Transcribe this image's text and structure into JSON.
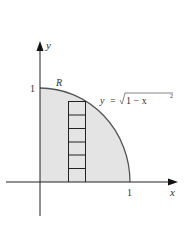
{
  "figure": {
    "axis_labels": {
      "x": "x",
      "y": "y"
    },
    "ticks": {
      "x_one": "1",
      "y_one": "1"
    },
    "region_label": "R",
    "equation": {
      "lhs": "y",
      "eq": "=",
      "radicand": "1 − x",
      "exp": "2"
    },
    "strip_cells": 6,
    "colors": {
      "fill": "#e4e4e4",
      "curve": "#555555",
      "axis": "#222222",
      "strip": "#222222"
    }
  }
}
